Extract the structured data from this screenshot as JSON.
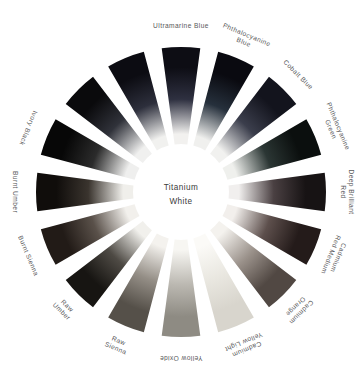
{
  "figure": {
    "name": "paint-color-wheel",
    "hub": {
      "label_line1": "Titanium",
      "label_line2": "White",
      "color": "#ffffff"
    },
    "background_color": "#ffffff",
    "label_color": "#58585a",
    "gap_color": "#ffffff",
    "segment_count": 16,
    "segments": [
      {
        "label": "Ultramarine Blue",
        "label_lines": [
          "Ultramarine Blue"
        ],
        "rim_color": "#0d0d14",
        "mid_color": "#2e3040",
        "hub_color": "#f2f1ef",
        "angle_deg": 0
      },
      {
        "label": "Phthalocyanine Blue",
        "label_lines": [
          "Phthalocyanine",
          "Blue"
        ],
        "rim_color": "#0a0a10",
        "mid_color": "#26303c",
        "hub_color": "#f0f0ee",
        "angle_deg": 22.5
      },
      {
        "label": "Cobalt Blue",
        "label_lines": [
          "Cobalt Blue"
        ],
        "rim_color": "#13141d",
        "mid_color": "#3b3e4c",
        "hub_color": "#f1f1ef",
        "angle_deg": 45
      },
      {
        "label": "Phthalocyanine Green",
        "label_lines": [
          "Phthalocyanine",
          "Green"
        ],
        "rim_color": "#0b0f0e",
        "mid_color": "#2b3634",
        "hub_color": "#eff0ed",
        "angle_deg": 67.5
      },
      {
        "label": "Deep Brilliant Red",
        "label_lines": [
          "Deep Brilliant",
          "Red"
        ],
        "rim_color": "#171314",
        "mid_color": "#4a4042",
        "hub_color": "#f1efee",
        "angle_deg": 90
      },
      {
        "label": "Cadmium Red Medium",
        "label_lines": [
          "Cadmium",
          "Red Medium"
        ],
        "rim_color": "#241b1a",
        "mid_color": "#5d4f4c",
        "hub_color": "#f2efec",
        "angle_deg": 112.5
      },
      {
        "label": "Cadmium Orange",
        "label_lines": [
          "Cadmium",
          "Orange"
        ],
        "rim_color": "#514843",
        "mid_color": "#9a918a",
        "hub_color": "#f4f2ee",
        "angle_deg": 135
      },
      {
        "label": "Cadmium Yellow Light",
        "label_lines": [
          "Cadmium",
          "Yellow Light"
        ],
        "rim_color": "#d8d5cd",
        "mid_color": "#e9e7e0",
        "hub_color": "#fbfaf7",
        "angle_deg": 157.5
      },
      {
        "label": "Yellow Oxide",
        "label_lines": [
          "Yellow Oxide"
        ],
        "rim_color": "#8e8b83",
        "mid_color": "#bbb8b1",
        "hub_color": "#f7f6f2",
        "angle_deg": 180
      },
      {
        "label": "Raw Sienna",
        "label_lines": [
          "Raw",
          "Sienna"
        ],
        "rim_color": "#555049",
        "mid_color": "#948e86",
        "hub_color": "#f4f2ee",
        "angle_deg": 202.5
      },
      {
        "label": "Raw Umber",
        "label_lines": [
          "Raw",
          "Umber"
        ],
        "rim_color": "#171512",
        "mid_color": "#4e4a44",
        "hub_color": "#f1f0ec",
        "angle_deg": 225
      },
      {
        "label": "Burnt Sienna",
        "label_lines": [
          "Burnt Sienna"
        ],
        "rim_color": "#221b17",
        "mid_color": "#5a514a",
        "hub_color": "#f2f0ec",
        "angle_deg": 247.5
      },
      {
        "label": "Burnt Umber",
        "label_lines": [
          "Burnt Umber"
        ],
        "rim_color": "#100d0b",
        "mid_color": "#3a342e",
        "hub_color": "#f0efeb",
        "angle_deg": 270
      },
      {
        "label": "Ivory Black",
        "label_lines": [
          "Ivory Black"
        ],
        "rim_color": "#070707",
        "mid_color": "#2b2b2b",
        "hub_color": "#efefee",
        "angle_deg": 292.5
      },
      {
        "label": "",
        "label_lines": [],
        "rim_color": "#0a0a0c",
        "mid_color": "#30323a",
        "hub_color": "#f0f0ef",
        "angle_deg": 315
      },
      {
        "label": "",
        "label_lines": [],
        "rim_color": "#0c0c12",
        "mid_color": "#2d2f3c",
        "hub_color": "#f1f1ef",
        "angle_deg": 337.5
      }
    ]
  }
}
